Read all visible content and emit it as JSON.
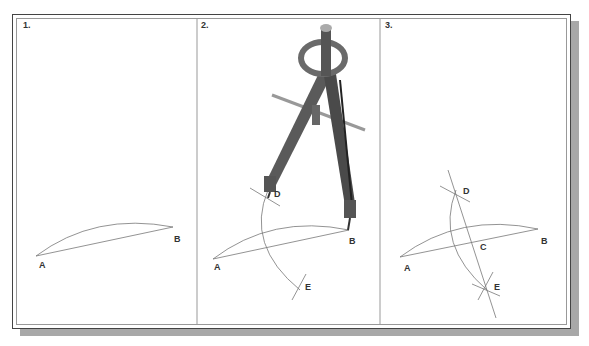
{
  "figure": {
    "panels": [
      {
        "step": "1.",
        "labels": {
          "A": "A",
          "B": "B"
        }
      },
      {
        "step": "2.",
        "labels": {
          "A": "A",
          "B": "B",
          "D": "D",
          "E": "E"
        }
      },
      {
        "step": "3.",
        "labels": {
          "A": "A",
          "B": "B",
          "C": "C",
          "D": "D",
          "E": "E"
        }
      }
    ]
  }
}
